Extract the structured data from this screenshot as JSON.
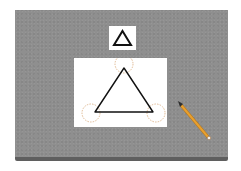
{
  "scene": {
    "description": "Gray board with reference triangle card, drawing canvas with triangle and highlighted vertices, and a pencil tool",
    "colors": {
      "board": "#8f8f8f",
      "board_edge": "#5f5f5f",
      "card": "#ffffff",
      "stroke": "#111111",
      "vertex_highlight": "#d8a878",
      "pencil_body": "#e8a030",
      "pencil_tip": "#333333"
    },
    "reference_shape": {
      "shape": "triangle",
      "label": "triangle-outline"
    },
    "drawing": {
      "shape": "triangle",
      "vertices": 3
    }
  }
}
